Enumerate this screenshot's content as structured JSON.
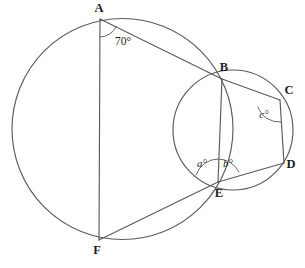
{
  "figure": {
    "stroke_color": "#5a5a5a",
    "label_color": "#1d1d1d",
    "background_color": "#ffffff"
  },
  "circles": [
    {
      "name": "large-circle",
      "cx": 122.5,
      "cy": 129,
      "r": 110.5
    },
    {
      "name": "small-circle",
      "cx": 233,
      "cy": 130,
      "r": 60
    }
  ],
  "points": {
    "A": {
      "label": "A",
      "x": 100,
      "y": 19,
      "label_x": 99,
      "label_y": 9
    },
    "B": {
      "label": "B",
      "x": 222,
      "y": 79,
      "label_x": 224,
      "label_y": 68
    },
    "C": {
      "label": "C",
      "x": 280,
      "y": 100,
      "label_x": 289,
      "label_y": 91
    },
    "D": {
      "label": "D",
      "x": 284,
      "y": 163,
      "label_x": 291,
      "label_y": 165
    },
    "E": {
      "label": "E",
      "x": 218,
      "y": 182,
      "label_x": 219,
      "label_y": 194
    },
    "F": {
      "label": "F",
      "x": 99,
      "y": 240,
      "label_x": 97,
      "label_y": 251
    }
  },
  "segments": [
    {
      "name": "segment-AF",
      "from": "A",
      "to": "F"
    },
    {
      "name": "segment-AB",
      "from": "A",
      "to": "B"
    },
    {
      "name": "segment-BC",
      "from": "B",
      "to": "C"
    },
    {
      "name": "segment-BE",
      "from": "B",
      "to": "E"
    },
    {
      "name": "segment-CD",
      "from": "C",
      "to": "D"
    },
    {
      "name": "segment-DE",
      "from": "D",
      "to": "E"
    },
    {
      "name": "segment-EF",
      "from": "E",
      "to": "F"
    }
  ],
  "angles": [
    {
      "name": "angle-at-A",
      "label": "70°",
      "style": "plain",
      "vertex": "A",
      "label_x": 123,
      "label_y": 42,
      "arc": "M 100 37 A 18 18 0 0 0 116.4 26.4"
    },
    {
      "name": "angle-a-at-E",
      "label": "a°",
      "style": "italic",
      "vertex": "E",
      "label_x": 202,
      "label_y": 164,
      "arc": "M 196 175 A 23 23 0 0 1 218 159"
    },
    {
      "name": "angle-b-at-E",
      "label": "b°",
      "style": "italic",
      "vertex": "E",
      "label_x": 228,
      "label_y": 164,
      "arc": "M 218 159 A 23 23 0 0 1 239 172"
    },
    {
      "name": "angle-c-at-C",
      "label": "c°",
      "style": "italic",
      "vertex": "C",
      "label_x": 264,
      "label_y": 115,
      "arc": "M 258 107 A 22 22 0 0 0 281 122"
    }
  ]
}
